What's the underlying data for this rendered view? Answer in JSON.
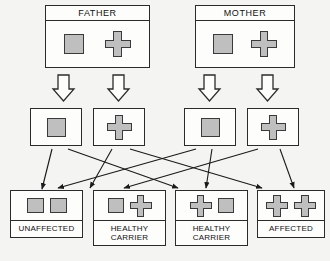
{
  "diagram": {
    "colors": {
      "allele_fill": "#bfbfbf",
      "outline": "#2b2b2b",
      "background": "#f4f4f2",
      "box_fill": "#fdfdfb"
    },
    "glyph_names": {
      "square": "normal-allele-square",
      "cross": "mutant-allele-cross"
    }
  },
  "parents": [
    {
      "title": "FATHER",
      "alleles": [
        "square",
        "cross"
      ]
    },
    {
      "title": "MOTHER",
      "alleles": [
        "square",
        "cross"
      ]
    }
  ],
  "meiosis_arrows": [
    {
      "from": "FATHER",
      "to": "gamete-1"
    },
    {
      "from": "FATHER",
      "to": "gamete-2"
    },
    {
      "from": "MOTHER",
      "to": "gamete-3"
    },
    {
      "from": "MOTHER",
      "to": "gamete-4"
    }
  ],
  "gametes": [
    {
      "allele": "square",
      "parent": "FATHER"
    },
    {
      "allele": "cross",
      "parent": "FATHER"
    },
    {
      "allele": "square",
      "parent": "MOTHER"
    },
    {
      "allele": "cross",
      "parent": "MOTHER"
    }
  ],
  "offspring": [
    {
      "alleles": [
        "square",
        "square"
      ],
      "label_lines": [
        "UNAFFECTED"
      ],
      "genotype": "normal/normal"
    },
    {
      "alleles": [
        "square",
        "cross"
      ],
      "label_lines": [
        "HEALTHY",
        "CARRIER"
      ],
      "genotype": "normal/mutant"
    },
    {
      "alleles": [
        "cross",
        "square"
      ],
      "label_lines": [
        "HEALTHY",
        "CARRIER"
      ],
      "genotype": "mutant/normal"
    },
    {
      "alleles": [
        "cross",
        "cross"
      ],
      "label_lines": [
        "AFFECTED"
      ],
      "genotype": "mutant/mutant"
    }
  ],
  "fertilization_arrows": [
    {
      "from": "gamete-1",
      "to": "offspring-1"
    },
    {
      "from": "gamete-1",
      "to": "offspring-2"
    },
    {
      "from": "gamete-2",
      "to": "offspring-3"
    },
    {
      "from": "gamete-2",
      "to": "offspring-4"
    },
    {
      "from": "gamete-3",
      "to": "offspring-1"
    },
    {
      "from": "gamete-3",
      "to": "offspring-3"
    },
    {
      "from": "gamete-4",
      "to": "offspring-2"
    },
    {
      "from": "gamete-4",
      "to": "offspring-4"
    }
  ]
}
